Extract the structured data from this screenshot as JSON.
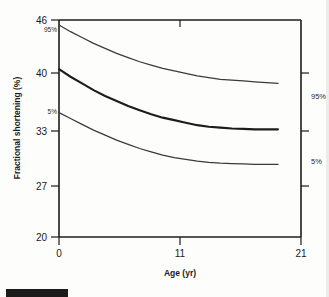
{
  "chart_data": {
    "type": "line",
    "title": "",
    "subtitle": "",
    "xlabel": "Age (yr)",
    "ylabel": "Fractional shortening (%)",
    "xlim": [
      0,
      21
    ],
    "ylim": [
      20,
      46
    ],
    "xticks": [
      0,
      11,
      21
    ],
    "xtick_labels": [
      "0",
      "11",
      "21"
    ],
    "yticks": [
      20,
      27,
      33,
      40,
      46
    ],
    "ytick_labels": [
      "20",
      "27",
      "33",
      "40",
      "46"
    ],
    "grid": false,
    "legend_position": "inline-annotations",
    "annotations": [
      {
        "text": "95%",
        "where": "left-start-upper-curve"
      },
      {
        "text": "5%",
        "where": "left-start-lower-curve"
      },
      {
        "text": "95%",
        "where": "right-axis-upper"
      },
      {
        "text": "5%",
        "where": "right-axis-lower"
      }
    ],
    "right_axis_ticks": [
      40,
      33,
      27
    ],
    "series": [
      {
        "name": "95%",
        "label": "95%",
        "style": "thin",
        "x": [
          0,
          1,
          2,
          3,
          4,
          5,
          6,
          7,
          8,
          9,
          10,
          11,
          12,
          13,
          14,
          15,
          16,
          17,
          18,
          19
        ],
        "values": [
          45.4,
          44.6,
          43.9,
          43.2,
          42.6,
          42.0,
          41.5,
          41.0,
          40.6,
          40.2,
          39.9,
          39.6,
          39.3,
          39.1,
          38.9,
          38.8,
          38.7,
          38.6,
          38.5,
          38.4
        ]
      },
      {
        "name": "mean",
        "label": "mean",
        "style": "bold",
        "x": [
          0,
          1,
          2,
          3,
          4,
          5,
          6,
          7,
          8,
          9,
          10,
          11,
          12,
          13,
          14,
          15,
          16,
          17,
          18,
          19
        ],
        "values": [
          40.1,
          39.2,
          38.4,
          37.6,
          36.9,
          36.3,
          35.7,
          35.2,
          34.7,
          34.3,
          34.0,
          33.7,
          33.4,
          33.2,
          33.1,
          33.0,
          32.95,
          32.9,
          32.9,
          32.9
        ]
      },
      {
        "name": "5%",
        "label": "5%",
        "style": "thin",
        "x": [
          0,
          1,
          2,
          3,
          4,
          5,
          6,
          7,
          8,
          9,
          10,
          11,
          12,
          13,
          14,
          15,
          16,
          17,
          18,
          19
        ],
        "values": [
          34.9,
          34.2,
          33.5,
          32.8,
          32.2,
          31.6,
          31.1,
          30.6,
          30.2,
          29.8,
          29.5,
          29.3,
          29.1,
          28.95,
          28.85,
          28.8,
          28.75,
          28.7,
          28.7,
          28.7
        ]
      }
    ],
    "colors": {
      "axis": "#1c1c1c",
      "curve_thin": "#3a3a3a",
      "curve_bold": "#1c1c1c",
      "background": "#fdfdfc"
    }
  }
}
